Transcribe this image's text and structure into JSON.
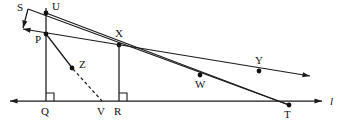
{
  "figure": {
    "kind": "geometry-diagram",
    "width": 353,
    "height": 126,
    "background_color": "#ffffff",
    "ink_color": "#1b1b1b",
    "line_label": "l",
    "line_label_position": {
      "x": 330,
      "y": 96
    }
  },
  "points": [
    {
      "id": "S",
      "label": "S",
      "x": 28,
      "y": 9,
      "dot": false,
      "label_x": 17,
      "label_y": 2
    },
    {
      "id": "U",
      "label": "U",
      "x": 46,
      "y": 13,
      "dot": true,
      "label_x": 52,
      "label_y": 1
    },
    {
      "id": "P",
      "label": "P",
      "x": 46,
      "y": 34,
      "dot": true,
      "label_x": 35,
      "label_y": 34
    },
    {
      "id": "X",
      "label": "X",
      "x": 119,
      "y": 45,
      "dot": true,
      "label_x": 115,
      "label_y": 28
    },
    {
      "id": "Z",
      "label": "Z",
      "x": 72,
      "y": 68,
      "dot": true,
      "label_x": 79,
      "label_y": 59
    },
    {
      "id": "Y",
      "label": "Y",
      "x": 259,
      "y": 71,
      "dot": true,
      "label_x": 255,
      "label_y": 55
    },
    {
      "id": "W",
      "label": "W",
      "x": 200,
      "y": 75,
      "dot": true,
      "label_x": 195,
      "label_y": 79
    },
    {
      "id": "Q",
      "label": "Q",
      "x": 46,
      "y": 101,
      "dot": false,
      "label_x": 41,
      "label_y": 106
    },
    {
      "id": "V",
      "label": "V",
      "x": 102,
      "y": 101,
      "dot": false,
      "label_x": 97,
      "label_y": 106
    },
    {
      "id": "R",
      "label": "R",
      "x": 119,
      "y": 101,
      "dot": false,
      "label_x": 114,
      "label_y": 106
    },
    {
      "id": "T",
      "label": "T",
      "x": 289,
      "y": 105,
      "dot": true,
      "label_x": 284,
      "label_y": 109
    }
  ],
  "segments": [
    {
      "name": "line-l",
      "from": [
        10,
        101
      ],
      "to": [
        322,
        101
      ],
      "style": "solid",
      "arrow_start": true,
      "arrow_end": true
    },
    {
      "name": "vertical-QU",
      "from": [
        46,
        8
      ],
      "to": [
        46,
        101
      ],
      "style": "solid",
      "arrow_start": false,
      "arrow_end": false
    },
    {
      "name": "vertical-RX",
      "from": [
        119,
        45
      ],
      "to": [
        119,
        101
      ],
      "style": "solid",
      "arrow_start": false,
      "arrow_end": false
    },
    {
      "name": "ray-S-through-X-T",
      "from": [
        28,
        9
      ],
      "to": [
        289,
        105
      ],
      "style": "solid",
      "arrow_start": false,
      "arrow_end": false
    },
    {
      "name": "ray-S-through-P",
      "from": [
        28,
        9
      ],
      "to": [
        23,
        28
      ],
      "style": "solid",
      "arrow_start": false,
      "arrow_end": true
    },
    {
      "name": "ray-P-X-W-Y",
      "from": [
        23,
        29
      ],
      "to": [
        310,
        76
      ],
      "style": "solid",
      "arrow_start": true,
      "arrow_end": true
    },
    {
      "name": "segment-P-Z",
      "from": [
        46,
        34
      ],
      "to": [
        73,
        69
      ],
      "style": "solid",
      "arrow_start": false,
      "arrow_end": false
    },
    {
      "name": "segment-Z-V",
      "from": [
        73,
        69
      ],
      "to": [
        102,
        101
      ],
      "style": "dashed",
      "arrow_start": false,
      "arrow_end": false
    },
    {
      "name": "segment-U-T",
      "from": [
        46,
        13
      ],
      "to": [
        289,
        105
      ],
      "style": "solid",
      "arrow_start": false,
      "arrow_end": false
    }
  ],
  "right_angle_marks": [
    {
      "name": "right-angle-at-Q",
      "vertex": [
        46,
        101
      ],
      "size": 8,
      "dir_x": 1,
      "dir_y": -1
    },
    {
      "name": "right-angle-at-R",
      "vertex": [
        119,
        101
      ],
      "size": 8,
      "dir_x": 1,
      "dir_y": -1
    }
  ]
}
